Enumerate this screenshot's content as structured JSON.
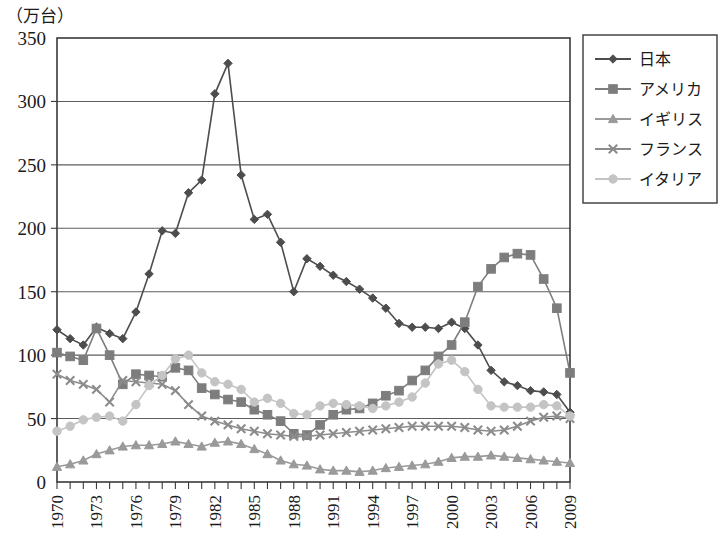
{
  "chart_data": {
    "type": "line",
    "title": "",
    "unit_caption": "（万台）",
    "xlabel": "",
    "ylabel": "",
    "ylim": [
      0,
      350
    ],
    "ytick_step": 50,
    "yticks": [
      "0",
      "50",
      "100",
      "150",
      "200",
      "250",
      "300",
      "350"
    ],
    "xlim": [
      1970,
      2009
    ],
    "x": [
      1970,
      1971,
      1972,
      1973,
      1974,
      1975,
      1976,
      1977,
      1978,
      1979,
      1980,
      1981,
      1982,
      1983,
      1984,
      1985,
      1986,
      1987,
      1988,
      1989,
      1990,
      1991,
      1992,
      1993,
      1994,
      1995,
      1996,
      1997,
      1998,
      1999,
      2000,
      2001,
      2002,
      2003,
      2004,
      2005,
      2006,
      2007,
      2008,
      2009
    ],
    "xticks": [
      "1970",
      "1973",
      "1976",
      "1979",
      "1982",
      "1985",
      "1988",
      "1991",
      "1994",
      "1997",
      "2000",
      "2003",
      "2006",
      "2009"
    ],
    "xtick_rotation": -90,
    "grid": "horizontal",
    "legend_position": "right",
    "series": [
      {
        "name": "日本",
        "marker": "diamond",
        "color": "#4d4d4d",
        "values": [
          120,
          113,
          108,
          122,
          117,
          113,
          134,
          164,
          198,
          196,
          228,
          238,
          306,
          330,
          242,
          207,
          211,
          189,
          150,
          176,
          170,
          163,
          158,
          152,
          145,
          137,
          125,
          122,
          122,
          121,
          126,
          121,
          108,
          88,
          79,
          76,
          72,
          71,
          69,
          55
        ]
      },
      {
        "name": "アメリカ",
        "marker": "square",
        "color": "#7d7d7d",
        "values": [
          102,
          99,
          96,
          121,
          100,
          77,
          85,
          84,
          83,
          90,
          88,
          74,
          69,
          65,
          63,
          57,
          53,
          48,
          38,
          37,
          45,
          53,
          57,
          58,
          62,
          68,
          72,
          80,
          88,
          99,
          108,
          126,
          154,
          168,
          177,
          180,
          179,
          160,
          137,
          86
        ]
      },
      {
        "name": "イギリス",
        "marker": "triangle",
        "color": "#9a9a9a",
        "values": [
          12,
          14,
          17,
          22,
          25,
          28,
          29,
          29,
          30,
          32,
          30,
          28,
          31,
          32,
          30,
          26,
          22,
          17,
          14,
          13,
          10,
          9,
          9,
          8,
          9,
          11,
          12,
          13,
          14,
          16,
          19,
          20,
          20,
          21,
          20,
          19,
          18,
          17,
          16,
          15
        ]
      },
      {
        "name": "フランス",
        "marker": "cross",
        "color": "#8c8c8c",
        "values": [
          85,
          80,
          77,
          73,
          63,
          80,
          79,
          78,
          77,
          72,
          61,
          52,
          48,
          45,
          42,
          40,
          38,
          37,
          36,
          36,
          37,
          38,
          39,
          40,
          41,
          42,
          43,
          44,
          44,
          44,
          44,
          43,
          41,
          40,
          41,
          44,
          48,
          51,
          52,
          50
        ]
      },
      {
        "name": "イタリア",
        "marker": "circle-light",
        "color": "#c4c4c4",
        "values": [
          40,
          44,
          49,
          51,
          52,
          48,
          61,
          76,
          84,
          97,
          100,
          86,
          79,
          77,
          73,
          63,
          66,
          62,
          54,
          53,
          60,
          62,
          61,
          60,
          58,
          60,
          63,
          67,
          78,
          93,
          96,
          87,
          73,
          60,
          59,
          59,
          59,
          61,
          60,
          52
        ]
      }
    ]
  },
  "legend": {
    "entries": [
      {
        "label": "日本"
      },
      {
        "label": "アメリカ"
      },
      {
        "label": "イギリス"
      },
      {
        "label": "フランス"
      },
      {
        "label": "イタリア"
      }
    ]
  }
}
